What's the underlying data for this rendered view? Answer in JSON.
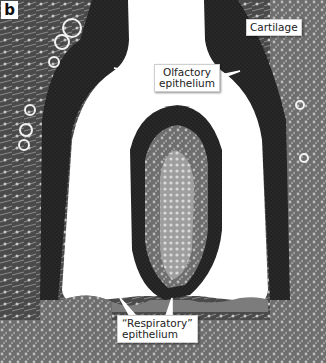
{
  "figure": {
    "panel_label": "b",
    "labels": {
      "cartilage": "Cartilage",
      "olfactory_line1": "Olfactory",
      "olfactory_line2": "epithelium",
      "respiratory_line1": "“Respiratory”",
      "respiratory_line2": "epithelium"
    },
    "colors": {
      "lumen": "#ffffff",
      "olfactory_epithelium": "#1e1e1e",
      "connective_tissue": "#6b6b6b",
      "callout_bg": "#ffffff"
    }
  }
}
